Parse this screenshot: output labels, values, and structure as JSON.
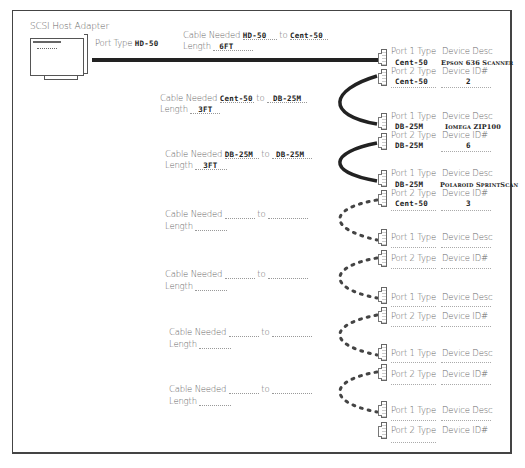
{
  "diagram": {
    "title": "SCSI Host Adapter",
    "host": {
      "label": "SCSI Host Adapter",
      "port_type_label": "Port Type",
      "port_type_value": "HD-50"
    },
    "labels": {
      "cable_needed": "Cable Needed",
      "to": "to",
      "length": "Length",
      "port1_type": "Port 1 Type",
      "port2_type": "Port 2 Type",
      "device_desc": "Device Desc",
      "device_id": "Device ID#"
    },
    "cables": [
      {
        "from": "HD-50",
        "to": "Cent-50",
        "length": "6FT",
        "style": "solid-thick"
      },
      {
        "from": "Cent-50",
        "to": "DB-25M",
        "length": "3FT",
        "style": "solid-curve"
      },
      {
        "from": "DB-25M",
        "to": "DB-25M",
        "length": "3FT",
        "style": "solid-curve"
      },
      {
        "from": "",
        "to": "",
        "length": "",
        "style": "dotted-curve"
      },
      {
        "from": "",
        "to": "",
        "length": "",
        "style": "dotted-curve"
      },
      {
        "from": "",
        "to": "",
        "length": "",
        "style": "dotted-curve"
      },
      {
        "from": "",
        "to": "",
        "length": "",
        "style": "dotted-curve"
      }
    ],
    "devices": [
      {
        "port1_type": "Cent-50",
        "device_desc": "Epson 636 Scanner",
        "port2_type": "Cent-50",
        "device_id": "2"
      },
      {
        "port1_type": "DB-25M",
        "device_desc": "Iomega ZIP100",
        "port2_type": "DB-25M",
        "device_id": "6"
      },
      {
        "port1_type": "DB-25M",
        "device_desc": "Polaroid SprintScan",
        "port2_type": "Cent-50",
        "device_id": "3"
      },
      {
        "port1_type": "",
        "device_desc": "",
        "port2_type": "",
        "device_id": ""
      },
      {
        "port1_type": "",
        "device_desc": "",
        "port2_type": "",
        "device_id": ""
      },
      {
        "port1_type": "",
        "device_desc": "",
        "port2_type": "",
        "device_id": ""
      },
      {
        "port1_type": "",
        "device_desc": "",
        "port2_type": "",
        "device_id": ""
      }
    ]
  }
}
